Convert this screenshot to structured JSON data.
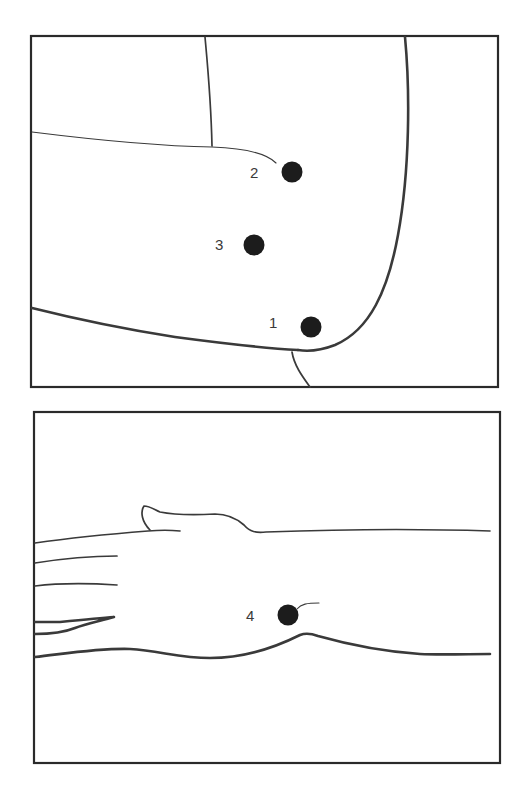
{
  "figure": {
    "panels": [
      {
        "id": "elbow",
        "view": "bent elbow, lateral aspect",
        "points": [
          {
            "label": "1"
          },
          {
            "label": "2"
          },
          {
            "label": "3"
          }
        ]
      },
      {
        "id": "wrist",
        "view": "forearm and hand, dorsal/ulnar aspect",
        "points": [
          {
            "label": "4"
          }
        ]
      }
    ]
  },
  "colors": {
    "ink": "#2a2a2a",
    "point": "#1c1c1c",
    "background": "#ffffff"
  }
}
